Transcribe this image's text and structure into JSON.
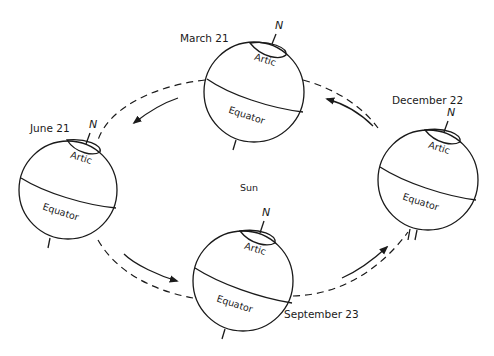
{
  "diagram": {
    "title": "",
    "center_label": "Sun",
    "globes": [
      {
        "id": "march",
        "date": "March 21",
        "north": "N",
        "arctic": "Artic",
        "equator": "Equator"
      },
      {
        "id": "june",
        "date": "June 21",
        "north": "N",
        "arctic": "Artic",
        "equator": "Equator"
      },
      {
        "id": "september",
        "date": "September 23",
        "north": "N",
        "arctic": "Artic",
        "equator": "Equator"
      },
      {
        "id": "december",
        "date": "December 22",
        "north": "N",
        "arctic": "Artic",
        "equator": "Equator"
      }
    ],
    "orbit_direction": "counterclockwise (March → June → September → December)",
    "colors": {
      "line": "#1a1a1a",
      "background": "#ffffff"
    }
  }
}
